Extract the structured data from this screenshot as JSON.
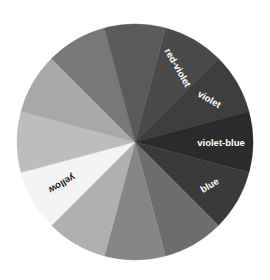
{
  "figure": {
    "name": "color-wheel",
    "background_color": "#ffffff",
    "center": {
      "x": 135,
      "y": 142
    },
    "radius": 118,
    "segment_count": 12,
    "segment_angle_deg": 30
  },
  "chart_data": {
    "type": "pie",
    "title": "",
    "subtitle": "",
    "xlabel": "",
    "ylabel": "",
    "legend_position": "none",
    "grid": false,
    "categories": [
      "red-violet",
      "violet",
      "violet-blue",
      "blue",
      "blue-green",
      "green",
      "yellow-green",
      "yellow",
      "yellow-orange",
      "orange",
      "red-orange",
      "red"
    ],
    "values": [
      1,
      1,
      1,
      1,
      1,
      1,
      1,
      1,
      1,
      1,
      1,
      1
    ],
    "segments": [
      {
        "index": 0,
        "label": "red-violet",
        "label_visible": true,
        "color": "#4a4a4a",
        "start_angle": -75,
        "end_angle": -45,
        "label_rotation": 60,
        "label_text_color": "#ffffff",
        "label_radius": 86
      },
      {
        "index": 1,
        "label": "violet",
        "label_visible": true,
        "color": "#3e3e3e",
        "start_angle": -45,
        "end_angle": -15,
        "label_rotation": 30,
        "label_text_color": "#ffffff",
        "label_radius": 86
      },
      {
        "index": 2,
        "label": "violet-blue",
        "label_visible": true,
        "color": "#2b2b2b",
        "start_angle": -15,
        "end_angle": 15,
        "label_rotation": 0,
        "label_text_color": "#ffffff",
        "label_radius": 86
      },
      {
        "index": 3,
        "label": "blue",
        "label_visible": true,
        "color": "#3a3a3a",
        "start_angle": 15,
        "end_angle": 45,
        "label_rotation": -30,
        "label_text_color": "#ffffff",
        "label_radius": 86
      },
      {
        "index": 4,
        "label": "blue-green",
        "label_visible": false,
        "color": "#6d6d6d",
        "start_angle": 45,
        "end_angle": 75,
        "label_rotation": -60,
        "label_text_color": "#ffffff",
        "label_radius": 86
      },
      {
        "index": 5,
        "label": "green",
        "label_visible": false,
        "color": "#868686",
        "start_angle": 75,
        "end_angle": 105,
        "label_rotation": -90,
        "label_text_color": "#ffffff",
        "label_radius": 86
      },
      {
        "index": 6,
        "label": "yellow-green",
        "label_visible": false,
        "color": "#b0b0b0",
        "start_angle": 105,
        "end_angle": 135,
        "label_rotation": -120,
        "label_text_color": "#1a1a1a",
        "label_radius": 86
      },
      {
        "index": 7,
        "label": "yellow",
        "label_visible": true,
        "color": "#f4f4f4",
        "start_angle": 135,
        "end_angle": 165,
        "label_rotation": 150,
        "label_text_color": "#1a1a1a",
        "label_radius": 84
      },
      {
        "index": 8,
        "label": "yellow-orange",
        "label_visible": false,
        "color": "#bdbdbd",
        "start_angle": 165,
        "end_angle": 195,
        "label_rotation": 180,
        "label_text_color": "#1a1a1a",
        "label_radius": 86
      },
      {
        "index": 9,
        "label": "orange",
        "label_visible": false,
        "color": "#a8a8a8",
        "start_angle": 195,
        "end_angle": 225,
        "label_rotation": 150,
        "label_text_color": "#1a1a1a",
        "label_radius": 86
      },
      {
        "index": 10,
        "label": "red-orange",
        "label_visible": false,
        "color": "#787878",
        "start_angle": 225,
        "end_angle": 255,
        "label_rotation": 120,
        "label_text_color": "#ffffff",
        "label_radius": 86
      },
      {
        "index": 11,
        "label": "red",
        "label_visible": false,
        "color": "#5a5a5a",
        "start_angle": 255,
        "end_angle": 285,
        "label_rotation": 90,
        "label_text_color": "#ffffff",
        "label_radius": 86
      }
    ],
    "visible_labels": [
      "red-violet",
      "violet",
      "violet-blue",
      "blue",
      "yellow"
    ]
  }
}
